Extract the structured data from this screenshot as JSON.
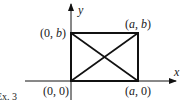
{
  "figure": {
    "caption": "Ex. 3",
    "axes": {
      "x_label": "x",
      "y_label": "y"
    },
    "points": [
      {
        "id": "origin",
        "label_open": "(",
        "a": "0",
        "sep": ", ",
        "b": "0",
        "label_close": ")"
      },
      {
        "id": "a0",
        "label_open": "(",
        "a": "a",
        "sep": ", ",
        "b": "0",
        "label_close": ")"
      },
      {
        "id": "ab",
        "label_open": "(",
        "a": "a",
        "sep": ", ",
        "b": "b",
        "label_close": ")"
      },
      {
        "id": "0b",
        "label_open": "(",
        "a": "0",
        "sep": ", ",
        "b": "b",
        "label_close": ")"
      }
    ],
    "shapes": [
      "rectangle",
      "diagonal-1",
      "diagonal-2"
    ],
    "colors": {
      "stroke": "#111111",
      "background": "#ffffff"
    }
  }
}
